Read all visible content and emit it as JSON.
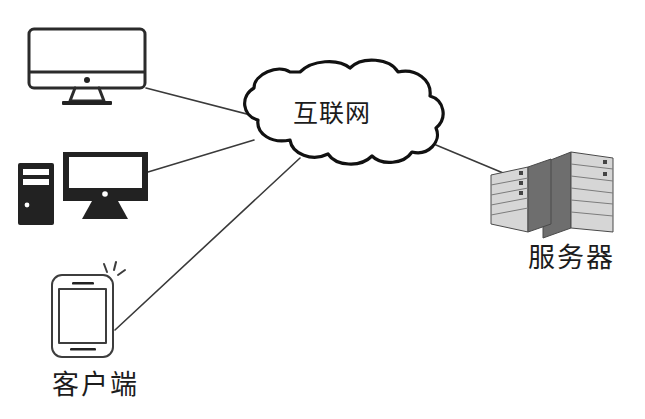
{
  "diagram": {
    "background_color": "#ffffff",
    "line_color": "#3a3a3a",
    "outline_color": "#111111"
  },
  "cloud": {
    "label": "互联网",
    "icon": "cloud-icon"
  },
  "clients": {
    "caption": "客户端",
    "devices": [
      {
        "id": "imac",
        "icon": "desktop-monitor-icon",
        "style": "outline"
      },
      {
        "id": "tower-pc",
        "icon": "desktop-computer-icon",
        "style": "solid"
      },
      {
        "id": "smartphone",
        "icon": "smartphone-icon",
        "style": "outline"
      }
    ]
  },
  "servers": {
    "caption": "服务器",
    "icon": "server-rack-icon",
    "count": 2,
    "front_color": "#d6d6d6",
    "side_color": "#6e6e6e"
  },
  "connections": [
    {
      "from": "imac",
      "to": "cloud"
    },
    {
      "from": "tower-pc",
      "to": "cloud"
    },
    {
      "from": "smartphone",
      "to": "cloud"
    },
    {
      "from": "cloud",
      "to": "servers"
    }
  ]
}
